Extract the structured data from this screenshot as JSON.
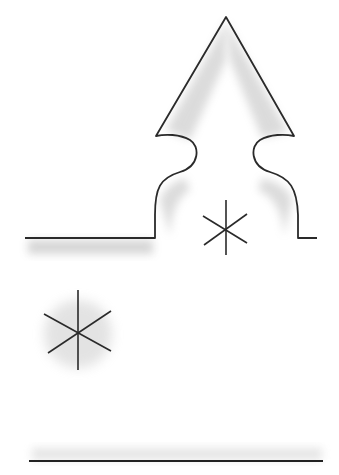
{
  "drawing": {
    "description": "Pencil sketch of a spire/arrow-topped shape on a ledge with two six-pointed asterisk marks and a ground line",
    "colors": {
      "stroke": "#2a2a2a",
      "shade": "#9a9a9a",
      "background": "#ffffff"
    },
    "shape": {
      "apex": [
        226,
        17
      ],
      "left_tip": [
        156,
        136
      ],
      "right_tip": [
        294,
        136
      ],
      "left_base_x": 155,
      "right_base_x": 298,
      "base_y": 238
    },
    "ledge_left": {
      "x1": 25,
      "x2": 155,
      "y": 238
    },
    "ledge_right": {
      "x1": 298,
      "x2": 317,
      "y": 238
    },
    "ground_line": {
      "x1": 29,
      "x2": 323,
      "y": 461
    },
    "stars": [
      {
        "name": "small",
        "cx": 226,
        "cy": 228,
        "r": 27
      },
      {
        "name": "large",
        "cx": 78,
        "cy": 332,
        "r": 40
      }
    ]
  }
}
